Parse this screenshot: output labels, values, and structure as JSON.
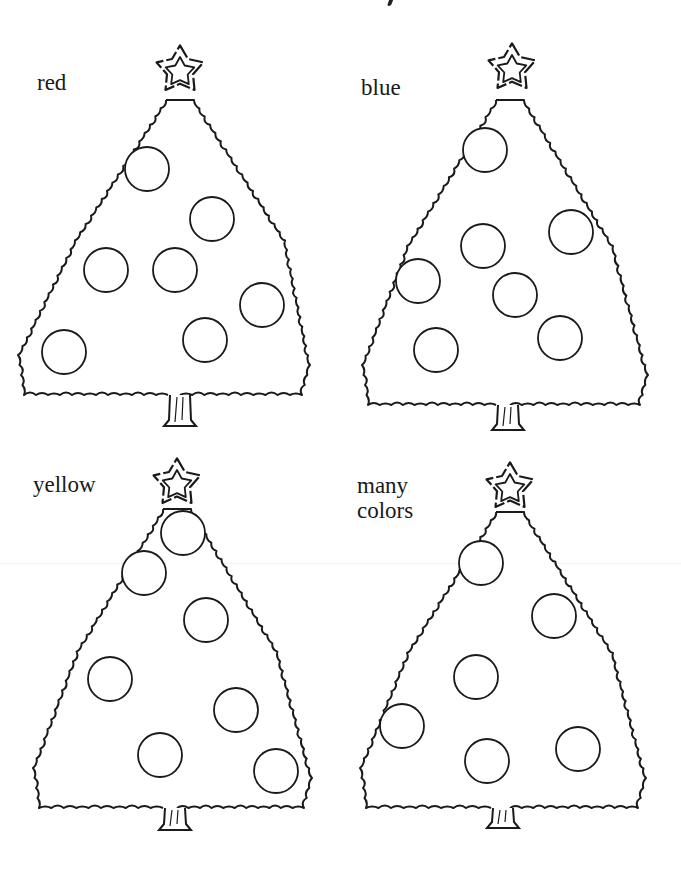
{
  "worksheet": {
    "trees": [
      {
        "id": "tree-red",
        "label": "red",
        "label_pos": {
          "x": 37,
          "y": 90
        },
        "star": {
          "cx": 180,
          "cy": 70,
          "r_outer": 30,
          "r_inner": 13
        },
        "canopy": {
          "apex_x": 180,
          "apex_y": 96,
          "left_x": 18,
          "right_x": 310,
          "bottom_y": 395
        },
        "trunk": {
          "cx": 180,
          "top_y": 395,
          "bottom_y": 426
        },
        "ornaments": [
          {
            "cx": 147,
            "cy": 169,
            "r": 22
          },
          {
            "cx": 212,
            "cy": 219,
            "r": 22
          },
          {
            "cx": 106,
            "cy": 270,
            "r": 22
          },
          {
            "cx": 175,
            "cy": 270,
            "r": 22
          },
          {
            "cx": 262,
            "cy": 305,
            "r": 22
          },
          {
            "cx": 205,
            "cy": 340,
            "r": 22
          },
          {
            "cx": 64,
            "cy": 352,
            "r": 22
          }
        ]
      },
      {
        "id": "tree-blue",
        "label": "blue",
        "label_pos": {
          "x": 361,
          "y": 95
        },
        "star": {
          "cx": 512,
          "cy": 68,
          "r_outer": 30,
          "r_inner": 13
        },
        "canopy": {
          "apex_x": 510,
          "apex_y": 96,
          "left_x": 362,
          "right_x": 648,
          "bottom_y": 405
        },
        "trunk": {
          "cx": 508,
          "top_y": 405,
          "bottom_y": 430
        },
        "ornaments": [
          {
            "cx": 485,
            "cy": 150,
            "r": 22
          },
          {
            "cx": 571,
            "cy": 232,
            "r": 22
          },
          {
            "cx": 483,
            "cy": 246,
            "r": 22
          },
          {
            "cx": 418,
            "cy": 281,
            "r": 22
          },
          {
            "cx": 515,
            "cy": 295,
            "r": 22
          },
          {
            "cx": 436,
            "cy": 350,
            "r": 22
          },
          {
            "cx": 560,
            "cy": 338,
            "r": 22
          }
        ]
      },
      {
        "id": "tree-yellow",
        "label": "yellow",
        "label_pos": {
          "x": 33,
          "y": 492
        },
        "star": {
          "cx": 177,
          "cy": 483,
          "r_outer": 30,
          "r_inner": 13
        },
        "canopy": {
          "apex_x": 177,
          "apex_y": 505,
          "left_x": 33,
          "right_x": 312,
          "bottom_y": 808
        },
        "trunk": {
          "cx": 175,
          "top_y": 808,
          "bottom_y": 830
        },
        "ornaments": [
          {
            "cx": 183,
            "cy": 533,
            "r": 22
          },
          {
            "cx": 144,
            "cy": 573,
            "r": 22
          },
          {
            "cx": 206,
            "cy": 620,
            "r": 22
          },
          {
            "cx": 110,
            "cy": 679,
            "r": 22
          },
          {
            "cx": 236,
            "cy": 710,
            "r": 22
          },
          {
            "cx": 160,
            "cy": 755,
            "r": 22
          },
          {
            "cx": 276,
            "cy": 771,
            "r": 22
          }
        ]
      },
      {
        "id": "tree-many-colors",
        "label": "many\ncolors",
        "label_pos": {
          "x": 357,
          "y": 493
        },
        "star": {
          "cx": 510,
          "cy": 487,
          "r_outer": 30,
          "r_inner": 13
        },
        "canopy": {
          "apex_x": 510,
          "apex_y": 508,
          "left_x": 360,
          "right_x": 646,
          "bottom_y": 808
        },
        "trunk": {
          "cx": 503,
          "top_y": 808,
          "bottom_y": 828
        },
        "ornaments": [
          {
            "cx": 481,
            "cy": 563,
            "r": 22
          },
          {
            "cx": 554,
            "cy": 616,
            "r": 22
          },
          {
            "cx": 476,
            "cy": 677,
            "r": 22
          },
          {
            "cx": 402,
            "cy": 726,
            "r": 22
          },
          {
            "cx": 487,
            "cy": 761,
            "r": 22
          },
          {
            "cx": 578,
            "cy": 749,
            "r": 22
          }
        ]
      }
    ],
    "colors": {
      "ink": "#1a1a1a",
      "paper": "#ffffff"
    }
  }
}
